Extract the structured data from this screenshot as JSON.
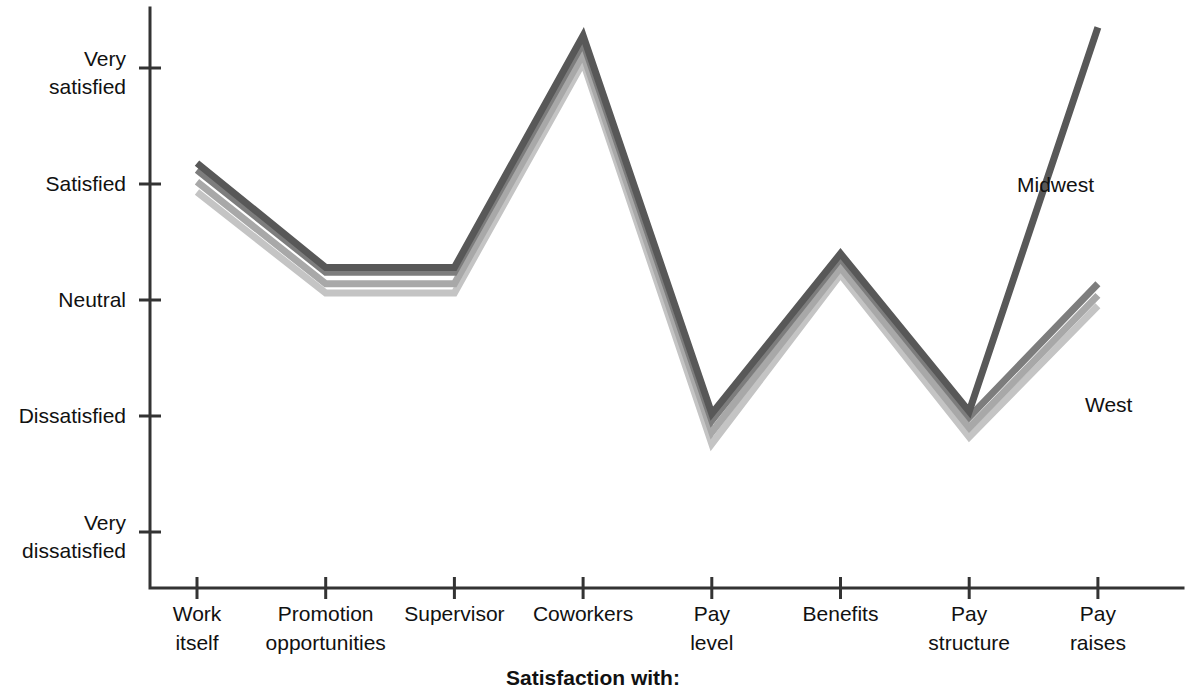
{
  "chart_data": {
    "type": "line",
    "title": "",
    "xlabel": "Satisfaction with:",
    "ylabel": "",
    "categories": [
      "Work itself",
      "Promotion opportunities",
      "Supervisor",
      "Coworkers",
      "Pay level",
      "Benefits",
      "Pay structure",
      "Pay raises"
    ],
    "category_lines": [
      [
        "Work",
        "itself"
      ],
      [
        "Promotion",
        "opportunities"
      ],
      [
        "Supervisor",
        ""
      ],
      [
        "Coworkers",
        ""
      ],
      [
        "Pay",
        "level"
      ],
      [
        "Benefits",
        ""
      ],
      [
        "Pay",
        "structure"
      ],
      [
        "Pay",
        "raises"
      ]
    ],
    "ytick_labels": [
      [
        "Very",
        "satisfied"
      ],
      [
        "Satisfied",
        ""
      ],
      [
        "Neutral",
        ""
      ],
      [
        "Dissatisfied",
        ""
      ],
      [
        "Very",
        "dissatisfied"
      ]
    ],
    "ytick_values": [
      5,
      4,
      3,
      2,
      1
    ],
    "ylim": [
      1,
      5
    ],
    "grid": false,
    "legend_position": "inline-right",
    "series": [
      {
        "name": "Midwest",
        "color": "#585858",
        "label_shown": true,
        "values": [
          4.18,
          3.28,
          3.28,
          5.28,
          2.02,
          3.4,
          2.04,
          5.35
        ]
      },
      {
        "name": "Northeast",
        "color": "#7d7d7d",
        "label_shown": false,
        "values": [
          4.12,
          3.24,
          3.24,
          5.22,
          1.96,
          3.36,
          1.99,
          3.14
        ]
      },
      {
        "name": "South",
        "color": "#a8a8a8",
        "label_shown": false,
        "values": [
          4.02,
          3.14,
          3.14,
          5.12,
          1.86,
          3.28,
          1.9,
          3.04
        ]
      },
      {
        "name": "West",
        "color": "#c4c4c4",
        "label_shown": true,
        "values": [
          3.93,
          3.06,
          3.06,
          5.05,
          1.76,
          3.22,
          1.82,
          2.95
        ]
      }
    ]
  },
  "annotations": {
    "midwest_label": "Midwest",
    "west_label": "West"
  }
}
